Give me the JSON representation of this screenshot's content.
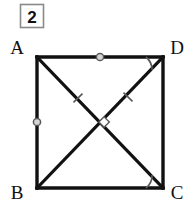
{
  "figure": {
    "problem_number": "2",
    "shape_name": "square",
    "background_color": "#ffffff",
    "stroke_color": "#111111",
    "mark_color": "#555555",
    "canvas": {
      "width": 191,
      "height": 216
    },
    "problem_box": {
      "x": 20,
      "y": 4,
      "width": 24,
      "height": 24,
      "border_color": "#8a8a8a"
    },
    "vertices": [
      {
        "id": "A",
        "label": "A",
        "x": 37,
        "y": 57,
        "label_x": 17,
        "label_y": 54
      },
      {
        "id": "D",
        "label": "D",
        "x": 163,
        "y": 57,
        "label_x": 168,
        "label_y": 54
      },
      {
        "id": "B",
        "label": "B",
        "x": 37,
        "y": 188,
        "label_x": 17,
        "label_y": 198
      },
      {
        "id": "C",
        "label": "C",
        "x": 163,
        "y": 188,
        "label_x": 168,
        "label_y": 198
      }
    ],
    "sides": [
      {
        "id": "AD",
        "from": "A",
        "to": "D"
      },
      {
        "id": "DC",
        "from": "D",
        "to": "C"
      },
      {
        "id": "CB",
        "from": "C",
        "to": "B"
      },
      {
        "id": "BA",
        "from": "B",
        "to": "A"
      }
    ],
    "diagonals": [
      {
        "id": "AC",
        "from": "A",
        "to": "C"
      },
      {
        "id": "BD",
        "from": "B",
        "to": "D"
      }
    ],
    "circle_marks": [
      {
        "id": "mark-AD-midpoint",
        "on": "AD",
        "x": 100,
        "y": 57
      },
      {
        "id": "mark-AB-midpoint",
        "on": "BA",
        "x": 37,
        "y": 122
      }
    ],
    "tick_marks": [
      {
        "id": "tick-on-AC",
        "on": "AC",
        "x": 78,
        "y": 98
      },
      {
        "id": "tick-on-BD",
        "on": "BD",
        "x": 128,
        "y": 97
      }
    ],
    "angle_arcs": [
      {
        "id": "angle-at-D",
        "vertex": "D",
        "x": 163,
        "y": 57,
        "radius": 17
      },
      {
        "id": "angle-at-C",
        "vertex": "C",
        "x": 163,
        "y": 188,
        "radius": 17
      }
    ],
    "right_angle_marks": [
      {
        "id": "right-angle-center",
        "x": 104,
        "y": 122,
        "size": 7
      }
    ],
    "intersection": {
      "id": "diagonal-intersection",
      "x": 100,
      "y": 122
    }
  }
}
